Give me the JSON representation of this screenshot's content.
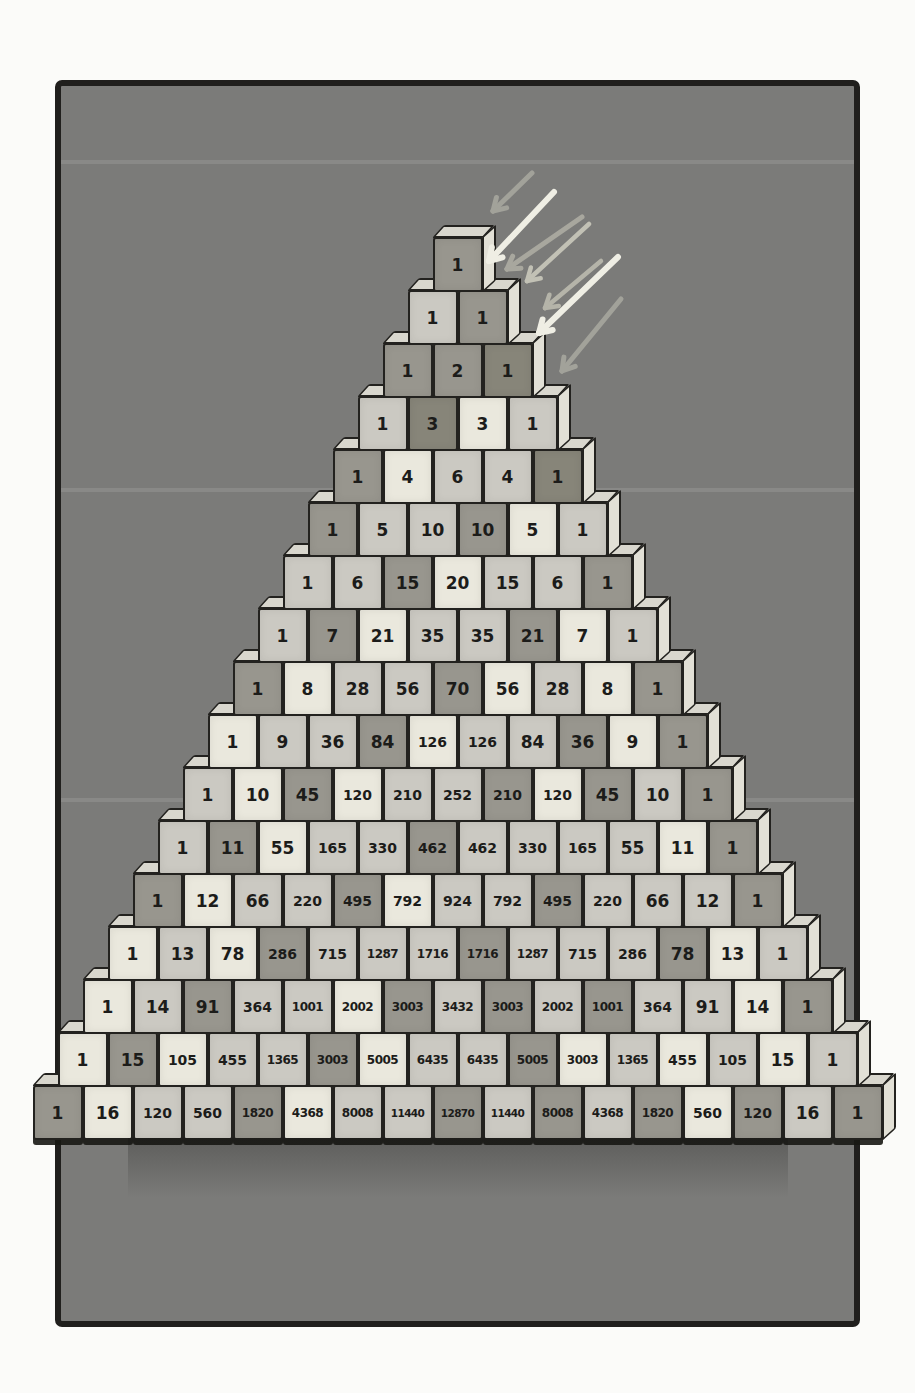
{
  "illustration": {
    "subject": "pascal-triangle-block-pyramid",
    "rows_count": 17
  },
  "colors": {
    "page_bg": "#fbfbf9",
    "panel_bg": "#7b7b79",
    "panel_border": "#201f1d",
    "ink": "#1c1c1a",
    "outline": "#23221f",
    "face_a": "#eae8dd",
    "face_b": "#cbc9c2",
    "face_c": "#98968e",
    "face_d": "#878579",
    "top_face": "#d9d7ce",
    "side_face": "#e2e0d6",
    "arrow_bright": "#efeee4",
    "arrow_dim": "#a2a29a"
  },
  "pyramid": {
    "rows": [
      {
        "values": [
          1
        ],
        "shades": [
          "c"
        ]
      },
      {
        "values": [
          1,
          1
        ],
        "shades": [
          "b",
          "c"
        ]
      },
      {
        "values": [
          1,
          2,
          1
        ],
        "shades": [
          "c",
          "c",
          "d"
        ]
      },
      {
        "values": [
          1,
          3,
          3,
          1
        ],
        "shades": [
          "b",
          "d",
          "a",
          "b"
        ]
      },
      {
        "values": [
          1,
          4,
          6,
          4,
          1
        ],
        "shades": [
          "c",
          "a",
          "b",
          "b",
          "d"
        ]
      },
      {
        "values": [
          1,
          5,
          10,
          10,
          5,
          1
        ],
        "shades": [
          "c",
          "b",
          "b",
          "c",
          "a",
          "b"
        ]
      },
      {
        "values": [
          1,
          6,
          15,
          20,
          15,
          6,
          1
        ],
        "shades": [
          "b",
          "b",
          "c",
          "a",
          "b",
          "b",
          "c"
        ]
      },
      {
        "values": [
          1,
          7,
          21,
          35,
          35,
          21,
          7,
          1
        ],
        "shades": [
          "b",
          "c",
          "a",
          "b",
          "b",
          "c",
          "a",
          "b"
        ]
      },
      {
        "values": [
          1,
          8,
          28,
          56,
          70,
          56,
          28,
          8,
          1
        ],
        "shades": [
          "c",
          "a",
          "b",
          "b",
          "c",
          "a",
          "b",
          "a",
          "c"
        ]
      },
      {
        "values": [
          1,
          9,
          36,
          84,
          126,
          126,
          84,
          36,
          9,
          1
        ],
        "shades": [
          "a",
          "b",
          "b",
          "c",
          "a",
          "b",
          "b",
          "c",
          "a",
          "c"
        ]
      },
      {
        "values": [
          1,
          10,
          45,
          120,
          210,
          252,
          210,
          120,
          45,
          10,
          1
        ],
        "shades": [
          "b",
          "a",
          "c",
          "a",
          "b",
          "b",
          "c",
          "a",
          "c",
          "b",
          "c"
        ]
      },
      {
        "values": [
          1,
          11,
          55,
          165,
          330,
          462,
          462,
          330,
          165,
          55,
          11,
          1
        ],
        "shades": [
          "b",
          "c",
          "a",
          "b",
          "b",
          "c",
          "b",
          "b",
          "b",
          "b",
          "a",
          "c"
        ]
      },
      {
        "values": [
          1,
          12,
          66,
          220,
          495,
          792,
          924,
          792,
          495,
          220,
          66,
          12,
          1
        ],
        "shades": [
          "c",
          "a",
          "b",
          "b",
          "c",
          "a",
          "b",
          "b",
          "c",
          "b",
          "b",
          "b",
          "c"
        ]
      },
      {
        "values": [
          1,
          13,
          78,
          286,
          715,
          1287,
          1716,
          1716,
          1287,
          715,
          286,
          78,
          13,
          1
        ],
        "shades": [
          "a",
          "b",
          "a",
          "c",
          "b",
          "b",
          "b",
          "c",
          "b",
          "b",
          "b",
          "c",
          "a",
          "b"
        ]
      },
      {
        "values": [
          1,
          14,
          91,
          364,
          1001,
          2002,
          3003,
          3432,
          3003,
          2002,
          1001,
          364,
          91,
          14,
          1
        ],
        "shades": [
          "a",
          "b",
          "c",
          "b",
          "b",
          "a",
          "c",
          "b",
          "c",
          "b",
          "c",
          "b",
          "b",
          "a",
          "c"
        ]
      },
      {
        "values": [
          1,
          15,
          105,
          455,
          1365,
          3003,
          5005,
          6435,
          6435,
          5005,
          3003,
          1365,
          455,
          105,
          15,
          1
        ],
        "shades": [
          "a",
          "c",
          "a",
          "b",
          "b",
          "c",
          "a",
          "b",
          "b",
          "c",
          "a",
          "b",
          "a",
          "b",
          "a",
          "b"
        ]
      },
      {
        "values": [
          1,
          16,
          120,
          560,
          1820,
          4368,
          8008,
          11440,
          12870,
          11440,
          8008,
          4368,
          1820,
          560,
          120,
          16,
          1
        ],
        "shades": [
          "c",
          "a",
          "b",
          "b",
          "c",
          "a",
          "b",
          "b",
          "c",
          "b",
          "c",
          "b",
          "c",
          "a",
          "c",
          "b",
          "c"
        ]
      }
    ]
  },
  "arrows": {
    "direction": "down-left-toward-apex",
    "items": [
      {
        "x1": 532,
        "y1": 173,
        "x2": 493,
        "y2": 211,
        "color": "#a2a29a",
        "width": 5
      },
      {
        "x1": 554,
        "y1": 192,
        "x2": 489,
        "y2": 261,
        "color": "#efeee4",
        "width": 6
      },
      {
        "x1": 582,
        "y1": 217,
        "x2": 507,
        "y2": 269,
        "color": "#a8a79e",
        "width": 5
      },
      {
        "x1": 589,
        "y1": 224,
        "x2": 527,
        "y2": 281,
        "color": "#c2c1b5",
        "width": 4.5
      },
      {
        "x1": 618,
        "y1": 257,
        "x2": 539,
        "y2": 333,
        "color": "#efeee4",
        "width": 6
      },
      {
        "x1": 601,
        "y1": 261,
        "x2": 545,
        "y2": 308,
        "color": "#b5b4a9",
        "width": 4.5
      },
      {
        "x1": 621,
        "y1": 299,
        "x2": 562,
        "y2": 371,
        "color": "#a2a29a",
        "width": 5
      }
    ]
  }
}
